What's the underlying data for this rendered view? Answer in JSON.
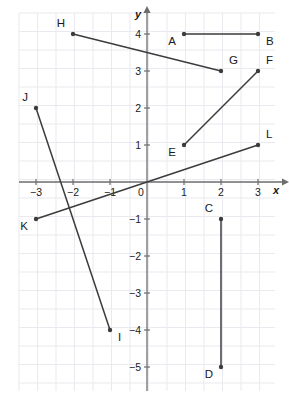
{
  "figure": {
    "axis": {
      "x_label": "x",
      "y_label": "y",
      "origin_label": "0",
      "x_ticks": [
        "-3",
        "-2",
        "-1",
        "1",
        "2",
        "3"
      ],
      "y_ticks": [
        "4",
        "3",
        "2",
        "1",
        "-1",
        "-2",
        "-3",
        "-4",
        "-5"
      ]
    },
    "colors": {
      "grid": "#e9e9ef",
      "axis": "#6d6d6d",
      "segment": "#3c3c3c",
      "label": "#1a1a1a",
      "background": "#ffffff"
    },
    "points": [
      {
        "id": "A",
        "label": "A",
        "x": 1,
        "y": 4,
        "label_pos": "left-below"
      },
      {
        "id": "B",
        "label": "B",
        "x": 3,
        "y": 4,
        "label_pos": "right-below"
      },
      {
        "id": "C",
        "label": "C",
        "x": 2,
        "y": -1,
        "label_pos": "left-above"
      },
      {
        "id": "D",
        "label": "D",
        "x": 2,
        "y": -5,
        "label_pos": "left-below"
      },
      {
        "id": "E",
        "label": "E",
        "x": 1,
        "y": 1,
        "label_pos": "left-below"
      },
      {
        "id": "F",
        "label": "F",
        "x": 3,
        "y": 3,
        "label_pos": "right-above"
      },
      {
        "id": "G",
        "label": "G",
        "x": 2,
        "y": 3,
        "label_pos": "right-above"
      },
      {
        "id": "H",
        "label": "H",
        "x": -2,
        "y": 4,
        "label_pos": "left-above"
      },
      {
        "id": "I",
        "label": "I",
        "x": -1,
        "y": -4,
        "label_pos": "right-below"
      },
      {
        "id": "J",
        "label": "J",
        "x": -3,
        "y": 2,
        "label_pos": "left-above"
      },
      {
        "id": "K",
        "label": "K",
        "x": -3,
        "y": -1,
        "label_pos": "left-below"
      },
      {
        "id": "L",
        "label": "L",
        "x": 3,
        "y": 1,
        "label_pos": "right-above"
      }
    ],
    "segments": [
      {
        "id": "AB",
        "from": "A",
        "to": "B"
      },
      {
        "id": "CD",
        "from": "C",
        "to": "D"
      },
      {
        "id": "EF",
        "from": "E",
        "to": "F"
      },
      {
        "id": "GH",
        "from": "H",
        "to": "G"
      },
      {
        "id": "IJ",
        "from": "J",
        "to": "I"
      },
      {
        "id": "KL",
        "from": "K",
        "to": "L"
      }
    ],
    "geometry": {
      "origin_x": 147,
      "origin_y": 182,
      "unit": 37,
      "half_grid": 18.5,
      "grid_left": 19,
      "grid_top": 13,
      "grid_right": 275,
      "grid_bottom": 391
    }
  }
}
